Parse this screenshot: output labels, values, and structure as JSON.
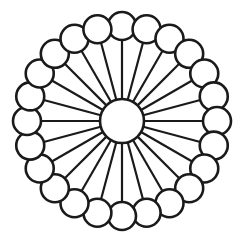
{
  "figure": {
    "background_color": "#ffffff",
    "stroke_color": "#1a1a1a",
    "fill_color": "#ffffff",
    "canvas": {
      "width": 244,
      "height": 244
    }
  },
  "hub": {
    "name": "center-hub-circle",
    "cx": 122,
    "cy": 121,
    "r": 22,
    "stroke_width": 2.6
  },
  "ring": {
    "node_count": 24,
    "ring_radius": 95,
    "node_radius": 14,
    "node_stroke_width": 2.6,
    "spoke_stroke_width": 2.2,
    "angle_step_degrees": 15,
    "start_angle_degrees": -90
  },
  "chart_data": {
    "type": "scatter",
    "subtitle": "",
    "xlabel": "",
    "ylabel": "",
    "grid": false,
    "legend_position": "none",
    "xlim": [
      0,
      244
    ],
    "ylim": [
      244,
      0
    ],
    "center": {
      "label": "hub",
      "x": 122,
      "y": 121,
      "radius": 22
    },
    "series": [
      {
        "name": "outer-nodes",
        "values": [
          {
            "index": 1,
            "angle_deg": 0,
            "x": 122.0,
            "y": 26.0,
            "radius": 14
          },
          {
            "index": 2,
            "angle_deg": 15,
            "x": 146.6,
            "y": 29.2,
            "radius": 14
          },
          {
            "index": 3,
            "angle_deg": 30,
            "x": 169.5,
            "y": 38.7,
            "radius": 14
          },
          {
            "index": 4,
            "angle_deg": 45,
            "x": 189.2,
            "y": 53.8,
            "radius": 14
          },
          {
            "index": 5,
            "angle_deg": 60,
            "x": 204.3,
            "y": 73.5,
            "radius": 14
          },
          {
            "index": 6,
            "angle_deg": 75,
            "x": 213.8,
            "y": 96.4,
            "radius": 14
          },
          {
            "index": 7,
            "angle_deg": 90,
            "x": 217.0,
            "y": 121.0,
            "radius": 14
          },
          {
            "index": 8,
            "angle_deg": 105,
            "x": 213.8,
            "y": 145.6,
            "radius": 14
          },
          {
            "index": 9,
            "angle_deg": 120,
            "x": 204.3,
            "y": 168.5,
            "radius": 14
          },
          {
            "index": 10,
            "angle_deg": 135,
            "x": 189.2,
            "y": 188.2,
            "radius": 14
          },
          {
            "index": 11,
            "angle_deg": 150,
            "x": 169.5,
            "y": 203.3,
            "radius": 14
          },
          {
            "index": 12,
            "angle_deg": 165,
            "x": 146.6,
            "y": 212.8,
            "radius": 14
          },
          {
            "index": 13,
            "angle_deg": 180,
            "x": 122.0,
            "y": 216.0,
            "radius": 14
          },
          {
            "index": 14,
            "angle_deg": 195,
            "x": 97.4,
            "y": 212.8,
            "radius": 14
          },
          {
            "index": 15,
            "angle_deg": 210,
            "x": 74.5,
            "y": 203.3,
            "radius": 14
          },
          {
            "index": 16,
            "angle_deg": 225,
            "x": 54.8,
            "y": 188.2,
            "radius": 14
          },
          {
            "index": 17,
            "angle_deg": 240,
            "x": 39.7,
            "y": 168.5,
            "radius": 14
          },
          {
            "index": 18,
            "angle_deg": 255,
            "x": 30.2,
            "y": 145.6,
            "radius": 14
          },
          {
            "index": 19,
            "angle_deg": 270,
            "x": 27.0,
            "y": 121.0,
            "radius": 14
          },
          {
            "index": 20,
            "angle_deg": 285,
            "x": 30.2,
            "y": 96.4,
            "radius": 14
          },
          {
            "index": 21,
            "angle_deg": 300,
            "x": 39.7,
            "y": 73.5,
            "radius": 14
          },
          {
            "index": 22,
            "angle_deg": 315,
            "x": 54.8,
            "y": 53.8,
            "radius": 14
          },
          {
            "index": 23,
            "angle_deg": 330,
            "x": 74.5,
            "y": 38.7,
            "radius": 14
          },
          {
            "index": 24,
            "angle_deg": 345,
            "x": 97.4,
            "y": 29.2,
            "radius": 14
          }
        ]
      }
    ]
  }
}
